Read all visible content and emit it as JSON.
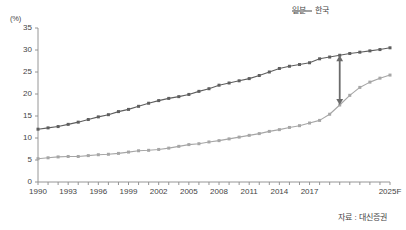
{
  "chart_data": {
    "type": "line",
    "title": "",
    "xlabel": "",
    "ylabel": "",
    "yunit": "(%)",
    "ylim": [
      0,
      35
    ],
    "yticks": [
      0,
      5,
      10,
      15,
      20,
      25,
      30,
      35
    ],
    "xlim": [
      1990,
      2025
    ],
    "xticks_major": [
      1990,
      1993,
      1996,
      1999,
      2002,
      2005,
      2008,
      2011,
      2014,
      2017
    ],
    "xtick_last_label": "2025F",
    "grid": false,
    "legend_position": "top-right",
    "x": [
      1990,
      1991,
      1992,
      1993,
      1994,
      1995,
      1996,
      1997,
      1998,
      1999,
      2000,
      2001,
      2002,
      2003,
      2004,
      2005,
      2006,
      2007,
      2008,
      2009,
      2010,
      2011,
      2012,
      2013,
      2014,
      2015,
      2016,
      2017,
      2018,
      2019,
      2020,
      2021,
      2022,
      2023,
      2024,
      2025
    ],
    "series": [
      {
        "name": "일본",
        "color": "#5e5e5e",
        "values": [
          12.0,
          12.3,
          12.6,
          13.1,
          13.6,
          14.2,
          14.8,
          15.3,
          16.0,
          16.5,
          17.2,
          17.9,
          18.5,
          19.0,
          19.4,
          19.9,
          20.6,
          21.2,
          22.0,
          22.5,
          23.0,
          23.5,
          24.2,
          25.0,
          25.8,
          26.3,
          26.7,
          27.1,
          28.0,
          28.4,
          28.8,
          29.2,
          29.5,
          29.8,
          30.1,
          30.5
        ]
      },
      {
        "name": "한국",
        "color": "#a6a6a6",
        "values": [
          5.3,
          5.5,
          5.7,
          5.8,
          5.8,
          6.0,
          6.2,
          6.3,
          6.5,
          6.8,
          7.1,
          7.2,
          7.4,
          7.7,
          8.1,
          8.5,
          8.7,
          9.1,
          9.4,
          9.8,
          10.2,
          10.6,
          11.0,
          11.5,
          11.9,
          12.4,
          12.8,
          13.4,
          14.0,
          15.4,
          17.5,
          19.7,
          21.5,
          22.7,
          23.6,
          24.3
        ]
      }
    ],
    "annotations": [
      {
        "type": "double-arrow",
        "orientation": "vertical",
        "x": 2020,
        "y_top": 28.8,
        "y_bottom": 17.5,
        "color": "#6b6b6b",
        "note": "gap between 일본 and 한국 around 2020"
      }
    ]
  },
  "legend": {
    "items": [
      {
        "label": "일본",
        "color": "#5e5e5e"
      },
      {
        "label": "한국",
        "color": "#a6a6a6"
      }
    ]
  },
  "axis": {
    "unit": "(%)",
    "y": [
      "35",
      "30",
      "25",
      "20",
      "15",
      "10",
      "5",
      "0"
    ],
    "x": [
      "1990",
      "1993",
      "1996",
      "1999",
      "2002",
      "2005",
      "2008",
      "2011",
      "2014",
      "2017",
      "2025F"
    ]
  },
  "footer": {
    "source": "자료 : 대신증권"
  }
}
